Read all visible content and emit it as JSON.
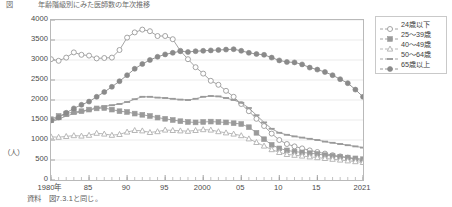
{
  "figure": {
    "number": "図",
    "caption": "年齢階級別にみた医師数の年次推移",
    "unit_label": "（人）",
    "source_note": "資料　図7.3.1と同じ。"
  },
  "chart_data": {
    "type": "line",
    "title": "年齢階級別にみた医師数の年次推移",
    "xlabel": "",
    "ylabel": "（人）",
    "ylim": [
      0,
      4000
    ],
    "ytick_values": [
      0,
      500,
      1000,
      1500,
      2000,
      2500,
      3000,
      3500,
      4000
    ],
    "ytick_labels": [
      "0",
      "500",
      "1000",
      "1500",
      "2000",
      "2500",
      "3000",
      "3500",
      "4000"
    ],
    "xlim": [
      1980,
      2021
    ],
    "xtick_values": [
      1980,
      1985,
      1990,
      1995,
      2000,
      2005,
      2010,
      2015,
      2021
    ],
    "xtick_labels": [
      "1980年",
      "85",
      "90",
      "95",
      "2000",
      "05",
      "10",
      "15",
      "2021"
    ],
    "grid": "horizontal",
    "legend_position": "outside-right",
    "x": [
      1980,
      1981,
      1982,
      1983,
      1984,
      1985,
      1986,
      1987,
      1988,
      1989,
      1990,
      1991,
      1992,
      1993,
      1994,
      1995,
      1996,
      1997,
      1998,
      1999,
      2000,
      2001,
      2002,
      2003,
      2004,
      2005,
      2006,
      2007,
      2008,
      2009,
      2010,
      2011,
      2012,
      2013,
      2014,
      2015,
      2016,
      2017,
      2018,
      2019,
      2020,
      2021
    ],
    "series": [
      {
        "name": "24歳以下",
        "marker": "open-circle",
        "linestyle": "solid",
        "color": "#9a9a9a",
        "values": [
          3020,
          2980,
          3060,
          3190,
          3130,
          3110,
          3040,
          3050,
          3060,
          3250,
          3560,
          3690,
          3760,
          3720,
          3600,
          3600,
          3520,
          3230,
          3020,
          2820,
          2660,
          2480,
          2380,
          2230,
          2080,
          1900,
          1720,
          1530,
          1350,
          1160,
          1000,
          900,
          840,
          790,
          740,
          700,
          660,
          620,
          590,
          560,
          520,
          480
        ]
      },
      {
        "name": "25〜39歳",
        "marker": "filled-square",
        "linestyle": "solid",
        "color": "#9a9a9a",
        "values": [
          1520,
          1600,
          1660,
          1700,
          1720,
          1760,
          1790,
          1800,
          1760,
          1720,
          1700,
          1660,
          1630,
          1600,
          1560,
          1530,
          1500,
          1470,
          1450,
          1440,
          1450,
          1460,
          1450,
          1440,
          1420,
          1400,
          1320,
          1180,
          1020,
          880,
          790,
          740,
          710,
          690,
          670,
          650,
          620,
          600,
          580,
          560,
          540,
          520
        ]
      },
      {
        "name": "40〜49歳",
        "marker": "open-triangle",
        "linestyle": "solid",
        "color": "#b0b0b0",
        "values": [
          1080,
          1070,
          1090,
          1110,
          1100,
          1120,
          1170,
          1150,
          1120,
          1140,
          1200,
          1240,
          1230,
          1190,
          1210,
          1250,
          1240,
          1230,
          1220,
          1240,
          1260,
          1250,
          1210,
          1180,
          1150,
          1110,
          1030,
          940,
          850,
          760,
          690,
          640,
          620,
          600,
          580,
          560,
          540,
          520,
          500,
          480,
          460,
          440
        ]
      },
      {
        "name": "50〜64歳",
        "marker": "dash",
        "linestyle": "dashed",
        "color": "#9a9a9a",
        "values": [
          1450,
          1520,
          1600,
          1660,
          1710,
          1750,
          1800,
          1840,
          1870,
          1900,
          1950,
          2020,
          2080,
          2080,
          2060,
          2050,
          2030,
          2010,
          2000,
          2030,
          2080,
          2100,
          2090,
          2050,
          2000,
          1930,
          1800,
          1620,
          1440,
          1280,
          1180,
          1130,
          1090,
          1060,
          1030,
          1000,
          960,
          930,
          900,
          870,
          840,
          810
        ]
      },
      {
        "name": "65歳以上",
        "marker": "filled-circle",
        "linestyle": "solid",
        "color": "#8a8a8a",
        "values": [
          1490,
          1560,
          1680,
          1790,
          1880,
          1960,
          2080,
          2200,
          2330,
          2470,
          2620,
          2780,
          2900,
          3000,
          3080,
          3140,
          3180,
          3220,
          3200,
          3220,
          3230,
          3240,
          3250,
          3260,
          3270,
          3230,
          3180,
          3150,
          3130,
          3060,
          2990,
          2950,
          2940,
          2890,
          2810,
          2760,
          2700,
          2620,
          2520,
          2420,
          2260,
          2080
        ]
      }
    ]
  },
  "legend": {
    "items": [
      {
        "label": "24歳以下",
        "marker": "open-circle",
        "linestyle": "solid"
      },
      {
        "label": "25〜39歳",
        "marker": "filled-square",
        "linestyle": "solid"
      },
      {
        "label": "40〜49歳",
        "marker": "open-triangle",
        "linestyle": "solid"
      },
      {
        "label": "50〜64歳",
        "marker": "dash",
        "linestyle": "dashed"
      },
      {
        "label": "65歳以上",
        "marker": "filled-circle",
        "linestyle": "solid"
      }
    ]
  }
}
